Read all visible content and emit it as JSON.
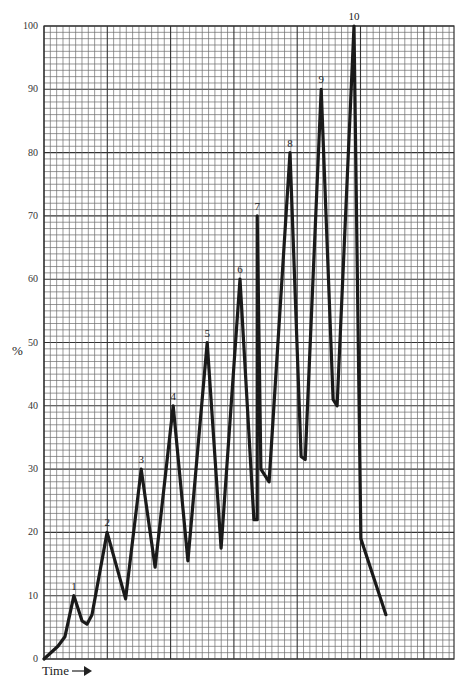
{
  "chart_data": {
    "type": "line",
    "title": "",
    "xlabel": "Time",
    "ylabel": "%",
    "ylim": [
      0,
      100
    ],
    "yticks": [
      0,
      10,
      20,
      30,
      40,
      50,
      60,
      70,
      80,
      90,
      100
    ],
    "grid": true,
    "legend": null,
    "x_axis_arrow": true,
    "series": [
      {
        "name": "level",
        "color": "#1a1a1a",
        "points": [
          {
            "x": 0.0,
            "y": 0
          },
          {
            "x": 3.4,
            "y": 2
          },
          {
            "x": 5.1,
            "y": 3.5
          },
          {
            "x": 7.3,
            "y": 10,
            "label": "1"
          },
          {
            "x": 9.3,
            "y": 6
          },
          {
            "x": 10.5,
            "y": 5.5
          },
          {
            "x": 11.7,
            "y": 7
          },
          {
            "x": 15.4,
            "y": 20,
            "label": "2"
          },
          {
            "x": 19.9,
            "y": 9.5
          },
          {
            "x": 23.7,
            "y": 30,
            "label": "3"
          },
          {
            "x": 27.1,
            "y": 14.5
          },
          {
            "x": 31.5,
            "y": 40,
            "label": "4"
          },
          {
            "x": 35.1,
            "y": 15.5
          },
          {
            "x": 39.8,
            "y": 50,
            "label": "5"
          },
          {
            "x": 43.2,
            "y": 17.5
          },
          {
            "x": 47.8,
            "y": 60,
            "label": "6"
          },
          {
            "x": 51.2,
            "y": 22
          },
          {
            "x": 52.0,
            "y": 22
          },
          {
            "x": 52.0,
            "y": 70,
            "label": "7"
          },
          {
            "x": 52.9,
            "y": 30
          },
          {
            "x": 54.9,
            "y": 28
          },
          {
            "x": 60.0,
            "y": 80,
            "label": "8"
          },
          {
            "x": 62.7,
            "y": 32
          },
          {
            "x": 63.7,
            "y": 31.5
          },
          {
            "x": 67.6,
            "y": 90,
            "label": "9"
          },
          {
            "x": 70.5,
            "y": 41
          },
          {
            "x": 71.5,
            "y": 40
          },
          {
            "x": 75.6,
            "y": 100,
            "label": "10"
          },
          {
            "x": 77.3,
            "y": 19
          },
          {
            "x": 83.4,
            "y": 7
          }
        ]
      }
    ],
    "peak_labels": [
      "1",
      "2",
      "3",
      "4",
      "5",
      "6",
      "7",
      "8",
      "9",
      "10"
    ],
    "peak_values": [
      10,
      20,
      30,
      40,
      50,
      60,
      70,
      80,
      90,
      100
    ],
    "trough_values": [
      5.5,
      9.5,
      14.5,
      15.5,
      17.5,
      22,
      28,
      31.5,
      40
    ],
    "final_value": 7
  },
  "axes": {
    "y_label": "%",
    "x_label": "Time",
    "x_arrow_glyph": "→"
  },
  "style": {
    "grid_minor_color": "#6b6b6b",
    "grid_major_color": "#333333",
    "line_color": "#1a1a1a",
    "background": "#ffffff"
  }
}
